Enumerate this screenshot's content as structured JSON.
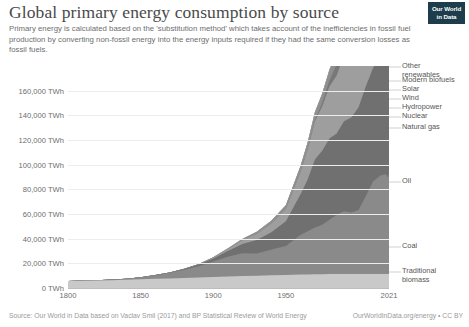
{
  "header": {
    "title": "Global primary energy consumption by source",
    "subtitle": "Primary energy is calculated based on the 'substitution method' which takes account of the inefficiencies in fossil fuel production by converting non-fossil energy into the energy inputs required if they had the same conversion losses as fossil fuels.",
    "logo_line1": "Our World",
    "logo_line2": "in Data"
  },
  "footer": {
    "source": "Source: Our World in Data based on Vaclav Smil (2017) and BP Statistical Review of World Energy",
    "credit": "OurWorldInData.org/energy • CC BY"
  },
  "chart_data": {
    "type": "area",
    "stacked": true,
    "title": "Global primary energy consumption by source",
    "xlabel": "",
    "ylabel": "",
    "ylim": [
      0,
      180000
    ],
    "xlim": [
      1800,
      2021
    ],
    "grid": true,
    "legend_position": "right-outside",
    "y_ticks": [
      0,
      20000,
      40000,
      60000,
      80000,
      100000,
      120000,
      140000,
      160000
    ],
    "y_tick_labels": [
      "0 TWh",
      "20,000 TWh",
      "40,000 TWh",
      "60,000 TWh",
      "80,000 TWh",
      "100,000 TWh",
      "120,000 TWh",
      "140,000 TWh",
      "160,000 TWh"
    ],
    "x_ticks": [
      1800,
      1850,
      1900,
      1950,
      2021
    ],
    "x_tick_labels": [
      "1800",
      "1850",
      "1900",
      "1950",
      "2021"
    ],
    "x": [
      1800,
      1810,
      1820,
      1830,
      1840,
      1850,
      1860,
      1870,
      1880,
      1890,
      1900,
      1910,
      1920,
      1930,
      1940,
      1950,
      1960,
      1965,
      1970,
      1975,
      1980,
      1985,
      1990,
      1995,
      2000,
      2005,
      2010,
      2015,
      2019,
      2020,
      2021
    ],
    "series": [
      {
        "name": "Traditional biomass",
        "color": "#c9c9c9",
        "values": [
          5600,
          5800,
          6000,
          6300,
          6600,
          7000,
          7400,
          7800,
          8200,
          8600,
          9000,
          9400,
          9700,
          10000,
          10300,
          10600,
          10900,
          11000,
          11100,
          11200,
          11300,
          11300,
          11300,
          11300,
          11300,
          11300,
          11300,
          11300,
          11300,
          11300,
          11300
        ]
      },
      {
        "name": "Coal",
        "color": "#8a8a8a",
        "values": [
          100,
          200,
          350,
          600,
          1000,
          1800,
          3000,
          4500,
          6500,
          9000,
          12500,
          16000,
          18500,
          18000,
          21000,
          23500,
          32000,
          35000,
          38000,
          40000,
          44000,
          48000,
          51000,
          50000,
          52000,
          63000,
          75000,
          80000,
          81000,
          78000,
          82000
        ]
      },
      {
        "name": "Oil",
        "color": "#707070",
        "values": [
          0,
          0,
          0,
          0,
          0,
          0,
          100,
          300,
          700,
          1400,
          2500,
          4500,
          7500,
          11000,
          14000,
          20000,
          33000,
          42000,
          55000,
          60000,
          66000,
          66000,
          73000,
          77000,
          83000,
          89000,
          92000,
          96000,
          100000,
          93000,
          97000
        ]
      },
      {
        "name": "Natural gas",
        "color": "#9e9e9e",
        "values": [
          0,
          0,
          0,
          0,
          0,
          0,
          0,
          50,
          150,
          350,
          700,
          1500,
          3000,
          5000,
          7000,
          10000,
          18000,
          24000,
          31000,
          36000,
          42000,
          47000,
          54000,
          58000,
          65000,
          73000,
          80000,
          87000,
          95000,
          94000,
          98000
        ]
      },
      {
        "name": "Nuclear",
        "color": "#787878",
        "values": [
          0,
          0,
          0,
          0,
          0,
          0,
          0,
          0,
          0,
          0,
          0,
          0,
          0,
          0,
          0,
          0,
          100,
          400,
          1000,
          2800,
          5000,
          9000,
          13000,
          15000,
          16000,
          17000,
          17000,
          16000,
          17000,
          16500,
          17000
        ]
      },
      {
        "name": "Hydropower",
        "color": "#8f8f8f",
        "values": [
          0,
          0,
          0,
          0,
          0,
          0,
          0,
          0,
          50,
          150,
          300,
          600,
          1000,
          1600,
          2200,
          3000,
          4500,
          5500,
          6500,
          7500,
          8500,
          9500,
          11000,
          12000,
          13000,
          14000,
          16000,
          17500,
          18500,
          18800,
          19000
        ]
      },
      {
        "name": "Wind",
        "color": "#b0b0b0",
        "values": [
          0,
          0,
          0,
          0,
          0,
          0,
          0,
          0,
          0,
          0,
          0,
          0,
          0,
          0,
          0,
          0,
          0,
          0,
          0,
          0,
          0,
          0,
          100,
          200,
          500,
          1100,
          2500,
          5000,
          8500,
          9500,
          11000
        ]
      },
      {
        "name": "Solar",
        "color": "#bdbdbd",
        "values": [
          0,
          0,
          0,
          0,
          0,
          0,
          0,
          0,
          0,
          0,
          0,
          0,
          0,
          0,
          0,
          0,
          0,
          0,
          0,
          0,
          0,
          0,
          0,
          0,
          50,
          100,
          400,
          1800,
          4500,
          5500,
          6500
        ]
      },
      {
        "name": "Modern biofuels",
        "color": "#a8a8a8",
        "values": [
          0,
          0,
          0,
          0,
          0,
          0,
          0,
          0,
          0,
          0,
          0,
          0,
          0,
          0,
          0,
          0,
          0,
          0,
          0,
          0,
          100,
          200,
          400,
          600,
          900,
          1400,
          2200,
          2700,
          3000,
          2900,
          3100
        ]
      },
      {
        "name": "Other renewables",
        "color": "#9a9a9a",
        "values": [
          0,
          0,
          0,
          0,
          0,
          0,
          0,
          0,
          0,
          0,
          0,
          0,
          0,
          0,
          0,
          0,
          0,
          0,
          100,
          200,
          400,
          700,
          1000,
          1300,
          1600,
          2000,
          2400,
          2800,
          3100,
          3200,
          3300
        ]
      }
    ],
    "legend_entries": [
      {
        "label": "Other\nrenewables",
        "y": 62
      },
      {
        "label": "Modern biofuels",
        "y": 76
      },
      {
        "label": "Solar",
        "y": 85
      },
      {
        "label": "Wind",
        "y": 94
      },
      {
        "label": "Hydropower",
        "y": 103
      },
      {
        "label": "Nuclear",
        "y": 112
      },
      {
        "label": "Natural gas",
        "y": 123
      },
      {
        "label": "Oil",
        "y": 177
      },
      {
        "label": "Coal",
        "y": 242
      },
      {
        "label": "Traditional\nbiomass",
        "y": 267
      }
    ]
  }
}
